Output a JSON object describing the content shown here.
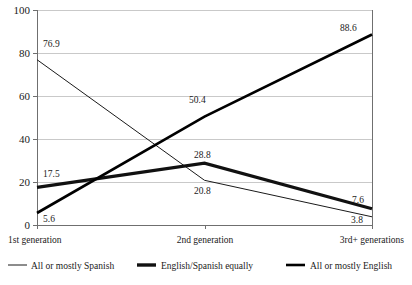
{
  "chart_data": {
    "type": "line",
    "title": "",
    "subtitle": "",
    "xlabel": "",
    "ylabel": "",
    "categories": [
      "1st generation",
      "2nd generation",
      "3rd+ generations"
    ],
    "ylim": [
      0,
      100
    ],
    "yticks": [
      "0",
      "20",
      "40",
      "60",
      "80",
      "100"
    ],
    "grid": true,
    "legend_position": "bottom",
    "series": [
      {
        "name": "All or mostly Spanish",
        "values": [
          76.9,
          20.8,
          3.8
        ],
        "labels": [
          "76.9",
          "20.8",
          "3.8"
        ],
        "style": "thin",
        "color": "#1a1a1a"
      },
      {
        "name": "English/Spanish equally",
        "values": [
          17.5,
          28.8,
          7.6
        ],
        "labels": [
          "17.5",
          "28.8",
          "7.6"
        ],
        "style": "medium",
        "color": "#111111"
      },
      {
        "name": "All or mostly English",
        "values": [
          5.6,
          50.4,
          88.6
        ],
        "labels": [
          "5.6",
          "50.4",
          "88.6"
        ],
        "style": "thick",
        "color": "#000000"
      }
    ]
  },
  "axis": {
    "ytick_0": "0",
    "ytick_20": "20",
    "ytick_40": "40",
    "ytick_60": "60",
    "ytick_80": "80",
    "ytick_100": "100",
    "xtick_1": "1st generation",
    "xtick_2": "2nd generation",
    "xtick_3": "3rd+ generations"
  },
  "labels": {
    "s1_p1": "76.9",
    "s1_p2": "20.8",
    "s1_p3": "3.8",
    "s2_p1": "17.5",
    "s2_p2": "28.8",
    "s2_p3": "7.6",
    "s3_p1": "5.6",
    "s3_p2": "50.4",
    "s3_p3": "88.6"
  },
  "legend": {
    "item1": "All or mostly Spanish",
    "item2": "English/Spanish equally",
    "item3": "All or mostly English"
  }
}
